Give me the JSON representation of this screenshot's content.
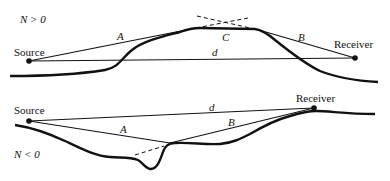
{
  "top_panel": {
    "condition": "N > 0",
    "source_label": "Source",
    "receiver_label": "Receiver",
    "path_labels": {
      "a": "A",
      "b": "B",
      "c": "C",
      "d": "d"
    }
  },
  "bottom_panel": {
    "condition": "N < 0",
    "source_label": "Source",
    "receiver_label": "Receiver",
    "path_labels": {
      "a": "A",
      "b": "B",
      "d": "d"
    }
  },
  "colors": {
    "line": "#111111",
    "background": "#ffffff"
  }
}
